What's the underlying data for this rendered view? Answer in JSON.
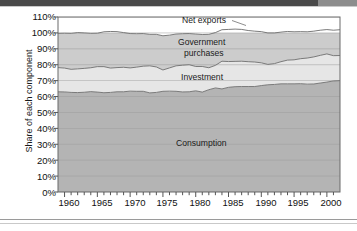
{
  "figure": {
    "background": "#ffffff",
    "band_color": "#4a4a4a",
    "band_accent": "#8d8d8d"
  },
  "axes": {
    "ylabel": "Share of each component",
    "xlabel": "",
    "yticks": [
      "0%",
      "10%",
      "20%",
      "30%",
      "40%",
      "50%",
      "60%",
      "70%",
      "80%",
      "90%",
      "100%",
      "110%"
    ],
    "xticks": [
      "1960",
      "1965",
      "1970",
      "1975",
      "1980",
      "1985",
      "1990",
      "1995",
      "2000"
    ]
  },
  "series_labels": {
    "net_exports": "Net exports",
    "government_line1": "Government",
    "government_line2": "purchases",
    "investment": "Investment",
    "consumption": "Consumption"
  },
  "colors": {
    "consumption": "#b4b4b4",
    "investment": "#e2e2e2",
    "government": "#c9c9c9",
    "net_exports": "#ffffff",
    "line": "#707070",
    "grid": "#a9a9a9",
    "axis": "#555555",
    "text": "#1a1a1a"
  },
  "chart_data": {
    "type": "area",
    "title": "",
    "xlabel": "",
    "ylabel": "Share of each component",
    "xlim": [
      1959,
      2002
    ],
    "ylim": [
      0,
      110
    ],
    "grid": true,
    "stacked": true,
    "legend_position": "inline-annotations",
    "x": [
      1959,
      1960,
      1961,
      1962,
      1963,
      1964,
      1965,
      1966,
      1967,
      1968,
      1969,
      1970,
      1971,
      1972,
      1973,
      1974,
      1975,
      1976,
      1977,
      1978,
      1979,
      1980,
      1981,
      1982,
      1983,
      1984,
      1985,
      1986,
      1987,
      1988,
      1989,
      1990,
      1991,
      1992,
      1993,
      1994,
      1995,
      1996,
      1997,
      1998,
      1999,
      2000,
      2001,
      2002
    ],
    "series": [
      {
        "name": "Consumption",
        "values": [
          63.0,
          62.9,
          62.6,
          62.5,
          62.7,
          63.1,
          62.8,
          62.4,
          62.6,
          63.0,
          63.0,
          63.4,
          63.3,
          63.3,
          62.3,
          62.6,
          63.3,
          63.4,
          63.3,
          62.9,
          63.0,
          63.6,
          62.8,
          64.3,
          65.4,
          64.8,
          65.8,
          66.2,
          66.3,
          66.3,
          66.3,
          66.9,
          67.4,
          67.6,
          68.0,
          68.0,
          68.0,
          68.1,
          67.8,
          67.9,
          68.5,
          69.1,
          69.8,
          70.0
        ],
        "cumulative_top": [
          63.0,
          62.9,
          62.6,
          62.5,
          62.7,
          63.1,
          62.8,
          62.4,
          62.6,
          63.0,
          63.0,
          63.4,
          63.3,
          63.3,
          62.3,
          62.6,
          63.3,
          63.4,
          63.3,
          62.9,
          63.0,
          63.6,
          62.8,
          64.3,
          65.4,
          64.8,
          65.8,
          66.2,
          66.3,
          66.3,
          66.3,
          66.9,
          67.4,
          67.6,
          68.0,
          68.0,
          68.0,
          68.1,
          67.8,
          67.9,
          68.5,
          69.1,
          69.8,
          70.0
        ]
      },
      {
        "name": "Investment",
        "values": [
          15.2,
          15.0,
          14.5,
          14.9,
          15.0,
          15.0,
          16.0,
          16.4,
          15.3,
          15.2,
          15.4,
          14.6,
          15.2,
          15.8,
          17.0,
          16.0,
          13.4,
          14.6,
          16.0,
          16.8,
          17.0,
          15.3,
          16.1,
          13.8,
          14.2,
          17.4,
          16.2,
          15.9,
          15.9,
          15.6,
          15.4,
          14.3,
          12.8,
          13.1,
          13.9,
          14.9,
          15.1,
          15.7,
          16.4,
          17.0,
          17.4,
          17.7,
          15.9,
          15.8
        ],
        "cumulative_top": [
          78.2,
          77.9,
          77.1,
          77.4,
          77.7,
          78.1,
          78.8,
          78.8,
          77.9,
          78.2,
          78.4,
          78.0,
          78.5,
          79.1,
          79.3,
          78.6,
          76.7,
          78.0,
          79.3,
          79.7,
          80.0,
          78.9,
          78.9,
          78.1,
          79.6,
          82.2,
          82.0,
          82.1,
          82.2,
          81.9,
          81.7,
          81.2,
          80.2,
          80.7,
          81.9,
          82.9,
          83.1,
          83.8,
          84.2,
          84.9,
          85.9,
          86.8,
          85.7,
          85.8
        ]
      },
      {
        "name": "Government purchases",
        "values": [
          21.5,
          21.9,
          22.6,
          22.8,
          22.3,
          21.6,
          21.0,
          21.9,
          23.0,
          22.6,
          21.8,
          21.6,
          21.0,
          20.5,
          19.8,
          20.5,
          21.5,
          20.6,
          20.0,
          19.8,
          19.6,
          20.4,
          20.1,
          21.0,
          20.6,
          19.8,
          20.2,
          20.3,
          20.0,
          19.6,
          19.4,
          19.6,
          19.8,
          19.3,
          18.6,
          18.0,
          17.6,
          17.0,
          16.5,
          16.2,
          15.8,
          15.3,
          16.0,
          16.2
        ],
        "cumulative_top": [
          99.7,
          99.8,
          99.7,
          100.2,
          100.0,
          99.7,
          99.8,
          100.7,
          100.9,
          100.8,
          100.2,
          99.6,
          99.5,
          99.6,
          99.1,
          99.1,
          98.2,
          98.6,
          99.3,
          99.5,
          99.6,
          99.3,
          99.0,
          99.1,
          100.2,
          102.0,
          102.2,
          102.4,
          102.2,
          101.5,
          101.1,
          100.8,
          100.0,
          100.0,
          100.5,
          100.9,
          100.7,
          100.8,
          100.7,
          101.1,
          101.7,
          102.1,
          101.7,
          102.0
        ]
      },
      {
        "name": "Net exports",
        "values": [
          0.3,
          0.2,
          0.3,
          -0.2,
          0.0,
          0.3,
          0.2,
          -0.7,
          -0.9,
          -0.8,
          -0.2,
          0.4,
          0.5,
          0.4,
          0.9,
          0.9,
          1.8,
          1.4,
          0.7,
          0.5,
          0.4,
          0.7,
          1.0,
          0.9,
          -0.2,
          -2.0,
          -2.2,
          -2.4,
          -2.2,
          -1.5,
          -1.1,
          -0.8,
          0.0,
          0.0,
          -0.5,
          -0.9,
          -0.7,
          -0.8,
          -0.7,
          -1.1,
          -1.7,
          -2.1,
          -1.7,
          -2.0
        ],
        "cumulative_top": [
          100,
          100,
          100,
          100,
          100,
          100,
          100,
          100,
          100,
          100,
          100,
          100,
          100,
          100,
          100,
          100,
          100,
          100,
          100,
          100,
          100,
          100,
          100,
          100,
          100,
          100,
          100,
          100,
          100,
          100,
          100,
          100,
          100,
          100,
          100,
          100,
          100,
          100,
          100,
          100,
          100,
          100,
          100,
          100
        ]
      }
    ]
  }
}
